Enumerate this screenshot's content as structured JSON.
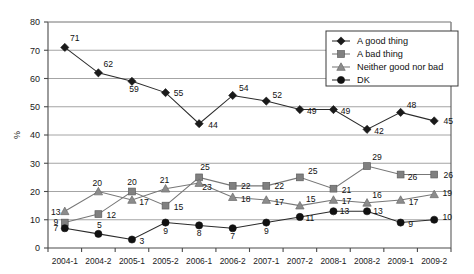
{
  "chart_data": {
    "type": "line",
    "title": "",
    "xlabel": "",
    "ylabel": "%",
    "ylim": [
      0,
      80
    ],
    "yticks": [
      0,
      10,
      20,
      30,
      40,
      50,
      60,
      70,
      80
    ],
    "grid": true,
    "legend_position": "top-right",
    "categories": [
      "2004-1",
      "2004-2",
      "2005-1",
      "2005-2",
      "2006-1",
      "2006-2",
      "2007-1",
      "2007-2",
      "2008-1",
      "2008-2",
      "2009-1",
      "2009-2"
    ],
    "series": [
      {
        "name": "A good thing",
        "marker": "diamond",
        "color": "#1a1a1a",
        "values": [
          71,
          62,
          59,
          55,
          44,
          54,
          52,
          49,
          49,
          42,
          48,
          45
        ]
      },
      {
        "name": "A bad thing",
        "marker": "square",
        "color": "#808080",
        "values": [
          9,
          12,
          20,
          15,
          25,
          22,
          22,
          25,
          21,
          29,
          26,
          26
        ]
      },
      {
        "name": "Neither good nor bad",
        "marker": "triangle",
        "color": "#8c8c8c",
        "values": [
          13,
          20,
          17,
          21,
          23,
          18,
          17,
          15,
          17,
          16,
          17,
          19
        ]
      },
      {
        "name": "DK",
        "marker": "circle",
        "color": "#111111",
        "values": [
          7,
          5,
          3,
          9,
          8,
          7,
          9,
          11,
          13,
          13,
          9,
          10
        ]
      }
    ]
  },
  "legend": {
    "items": [
      {
        "label": "A good thing",
        "marker": "diamond"
      },
      {
        "label": "A bad thing",
        "marker": "square"
      },
      {
        "label": "Neither good nor bad",
        "marker": "triangle"
      },
      {
        "label": "DK",
        "marker": "circle"
      }
    ]
  },
  "axis": {
    "y_title": "%"
  }
}
